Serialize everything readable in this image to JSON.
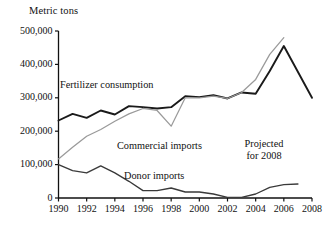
{
  "chart_data": {
    "type": "line",
    "title": "",
    "ylabel": "Metric tons",
    "xlabel": "",
    "ylim": [
      0,
      500000
    ],
    "xlim": [
      1990,
      2008
    ],
    "grid": false,
    "legend_position": "inline-annotations",
    "y_ticks": [
      "0",
      "100,000",
      "200,000",
      "300,000",
      "400,000",
      "500,000"
    ],
    "y_tick_values": [
      0,
      100000,
      200000,
      300000,
      400000,
      500000
    ],
    "x_ticks": [
      "1990",
      "1992",
      "1994",
      "1996",
      "1998",
      "2000",
      "2002",
      "2004",
      "2006",
      "2008"
    ],
    "x_tick_values": [
      1990,
      1992,
      1994,
      1996,
      1998,
      2000,
      2002,
      2004,
      2006,
      2008
    ],
    "x": [
      1990,
      1991,
      1992,
      1993,
      1994,
      1995,
      1996,
      1997,
      1998,
      1999,
      2000,
      2001,
      2002,
      2003,
      2004,
      2005,
      2006,
      2007,
      2008
    ],
    "series": [
      {
        "name": "Fertilizer consumption",
        "color": "#1a1a1a",
        "values": [
          232000,
          252000,
          240000,
          262000,
          250000,
          275000,
          272000,
          268000,
          272000,
          305000,
          302000,
          308000,
          298000,
          316000,
          312000,
          380000,
          455000,
          null,
          300000
        ]
      },
      {
        "name": "Commercial imports",
        "color": "#9a9a9a",
        "values": [
          117000,
          152000,
          185000,
          205000,
          230000,
          252000,
          268000,
          262000,
          215000,
          300000,
          300000,
          305000,
          298000,
          316000,
          355000,
          430000,
          480000,
          null,
          null
        ]
      },
      {
        "name": "Donor imports",
        "color": "#3a3a3a",
        "values": [
          100000,
          82000,
          75000,
          96000,
          75000,
          50000,
          22000,
          22000,
          30000,
          18000,
          18000,
          12000,
          2000,
          2000,
          12000,
          32000,
          40000,
          42000,
          null
        ]
      }
    ],
    "annotations": [
      {
        "text_line1": "Projected",
        "text_line2": "for 2008"
      }
    ]
  },
  "labels": {
    "y_axis_title": "Metric tons",
    "series_fertilizer": "Fertilizer consumption",
    "series_commercial": "Commercial imports",
    "series_donor": "Donor imports",
    "projected_line1": "Projected",
    "projected_line2": "for 2008"
  },
  "y_tick_labels": {
    "t500": "500,000",
    "t400": "400,000",
    "t300": "300,000",
    "t200": "200,000",
    "t100": "100,000",
    "t0": "0"
  },
  "x_tick_labels": {
    "y1990": "1990",
    "y1992": "1992",
    "y1994": "1994",
    "y1996": "1996",
    "y1998": "1998",
    "y2000": "2000",
    "y2002": "2002",
    "y2004": "2004",
    "y2006": "2006",
    "y2008": "2008"
  },
  "colors": {
    "fertilizer": "#1a1a1a",
    "commercial": "#9a9a9a",
    "donor": "#3a3a3a",
    "axis": "#111111",
    "background": "#ffffff"
  }
}
